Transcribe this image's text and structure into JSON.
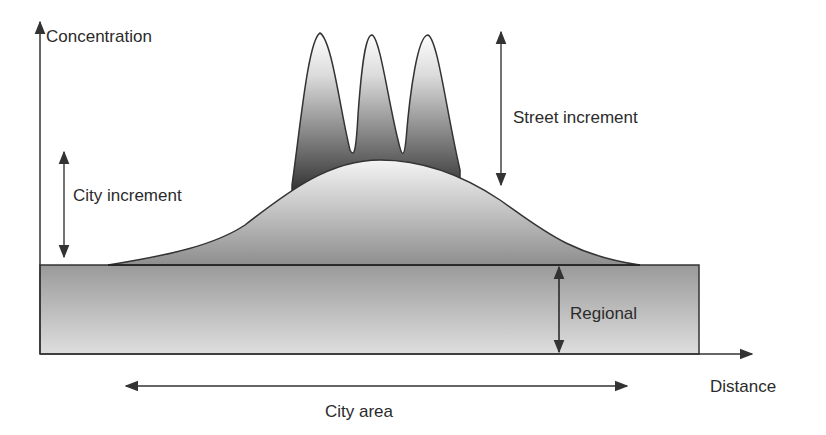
{
  "labels": {
    "y_axis": "Concentration",
    "x_axis": "Distance",
    "street_increment": "Street increment",
    "city_increment": "City increment",
    "regional": "Regional",
    "city_area": "City area"
  },
  "colors": {
    "line": "#333333",
    "text": "#2b2b2b",
    "regional_fill_top": "#9a9a9a",
    "regional_fill_bottom": "#dcdcdc",
    "city_hump_fill_top": "#f2f2f2",
    "city_hump_fill_bottom": "#8c8c8c",
    "street_peaks_fill_top": "#ffffff",
    "street_peaks_fill_bottom": "#2a2a2a"
  },
  "components": [
    {
      "name": "Regional",
      "description": "Uniform background band across the whole distance"
    },
    {
      "name": "City increment",
      "description": "Broad hump over the city area"
    },
    {
      "name": "Street increment",
      "description": "Three narrow peaks atop the city hump"
    }
  ]
}
